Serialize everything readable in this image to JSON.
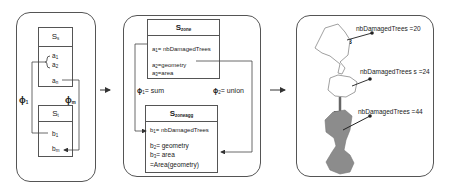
{
  "panel1": {
    "source_schema": {
      "title": "S",
      "title_sub": "s",
      "attrs": [
        "a",
        "a",
        "a"
      ],
      "attr_subs": [
        "1",
        "2",
        "n"
      ]
    },
    "target_schema": {
      "title": "S",
      "title_sub": "t",
      "attrs": [
        "b",
        "b"
      ],
      "attr_subs": [
        "1",
        "m"
      ]
    },
    "mapping_left": {
      "symbol": "ϕ",
      "sub": "1"
    },
    "mapping_right": {
      "symbol": "ϕ",
      "sub": "m"
    }
  },
  "panel2": {
    "zone_schema": {
      "title": "S",
      "title_sub": "zone",
      "attrs": [
        {
          "name": "a",
          "sub": "1",
          "value": "= nbDamagedTrees"
        },
        {
          "name": "a",
          "sub": "2",
          "value": "=geometry"
        },
        {
          "name": "a",
          "sub": "3",
          "value": "=area"
        }
      ]
    },
    "phi1": {
      "symbol": "ϕ",
      "sub": "1",
      "value": "= sum"
    },
    "phi2": {
      "symbol": "ϕ",
      "sub": "2",
      "value": "= union"
    },
    "zoneagg_schema": {
      "title": "S",
      "title_sub": "zoneagg",
      "attrs": [
        {
          "name": "b",
          "sub": "1",
          "value": "= nbDamagedTrees"
        },
        {
          "name": "b",
          "sub": "2",
          "value": "= geometry"
        },
        {
          "name": "b",
          "sub": "3",
          "value": "= area"
        }
      ],
      "extra_line": "=Area(geometry)"
    }
  },
  "panel3": {
    "zone3": {
      "label": "Zone 3",
      "annotation": "nbDamagedTrees =20"
    },
    "zone4": {
      "label": "Zone 4",
      "annotation": "nbDamagedTrees s =24"
    },
    "merged": {
      "annotation": "nbDamagedTrees  =44"
    }
  },
  "colors": {
    "line": "#333333",
    "border": "#555555",
    "merged_fill": "#8c8c8c",
    "zone_outline": "#888888"
  }
}
